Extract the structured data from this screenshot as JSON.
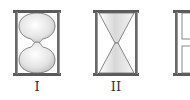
{
  "diagram": {
    "figures": [
      {
        "id": "I",
        "label": "I",
        "shape": "rounded-bulbs"
      },
      {
        "id": "II",
        "label": "II",
        "shape": "conical-triangles"
      },
      {
        "id": "III",
        "label": "III",
        "shape": "rectangular-chambers"
      }
    ]
  },
  "colors": {
    "frame": "#5a5a5a",
    "frame_light": "#9a9a9a",
    "glass_fill": "#e6e6e6",
    "glass_highlight": "#ffffff",
    "text": "#333333"
  }
}
